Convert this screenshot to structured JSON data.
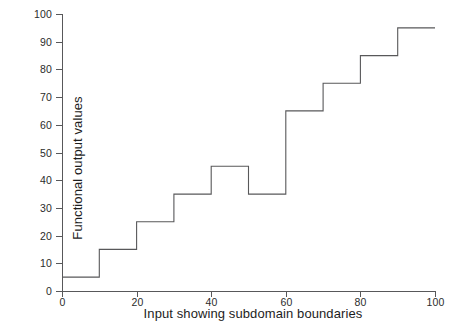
{
  "chart_data": {
    "type": "line",
    "step": "post",
    "title": "",
    "xlabel": "Input showing subdomain boundaries",
    "ylabel": "Functional output values",
    "xlim": [
      0,
      100
    ],
    "ylim": [
      0,
      100
    ],
    "xticks": [
      0,
      20,
      40,
      60,
      80,
      100
    ],
    "yticks": [
      0,
      10,
      20,
      30,
      40,
      50,
      60,
      70,
      80,
      90,
      100
    ],
    "xtick_labels": [
      "0",
      "20",
      "40",
      "60",
      "80",
      "100"
    ],
    "ytick_labels": [
      "0",
      "10",
      "20",
      "30",
      "40",
      "50",
      "60",
      "70",
      "80",
      "90",
      "100"
    ],
    "grid": false,
    "legend": null,
    "line_color": "#58585a",
    "subdomain_width": 10,
    "x_breaks": [
      0,
      10,
      20,
      30,
      40,
      50,
      60,
      70,
      80,
      90,
      100
    ],
    "values": [
      5,
      15,
      25,
      35,
      45,
      35,
      65,
      75,
      85,
      95
    ],
    "points": [
      {
        "x0": 0,
        "x1": 10,
        "y": 5
      },
      {
        "x0": 10,
        "x1": 20,
        "y": 15
      },
      {
        "x0": 20,
        "x1": 30,
        "y": 25
      },
      {
        "x0": 30,
        "x1": 40,
        "y": 35
      },
      {
        "x0": 40,
        "x1": 50,
        "y": 45
      },
      {
        "x0": 50,
        "x1": 60,
        "y": 35
      },
      {
        "x0": 60,
        "x1": 70,
        "y": 65
      },
      {
        "x0": 70,
        "x1": 80,
        "y": 75
      },
      {
        "x0": 80,
        "x1": 90,
        "y": 85
      },
      {
        "x0": 90,
        "x1": 100,
        "y": 95
      }
    ]
  },
  "figure": {
    "caption_fragment": ""
  }
}
